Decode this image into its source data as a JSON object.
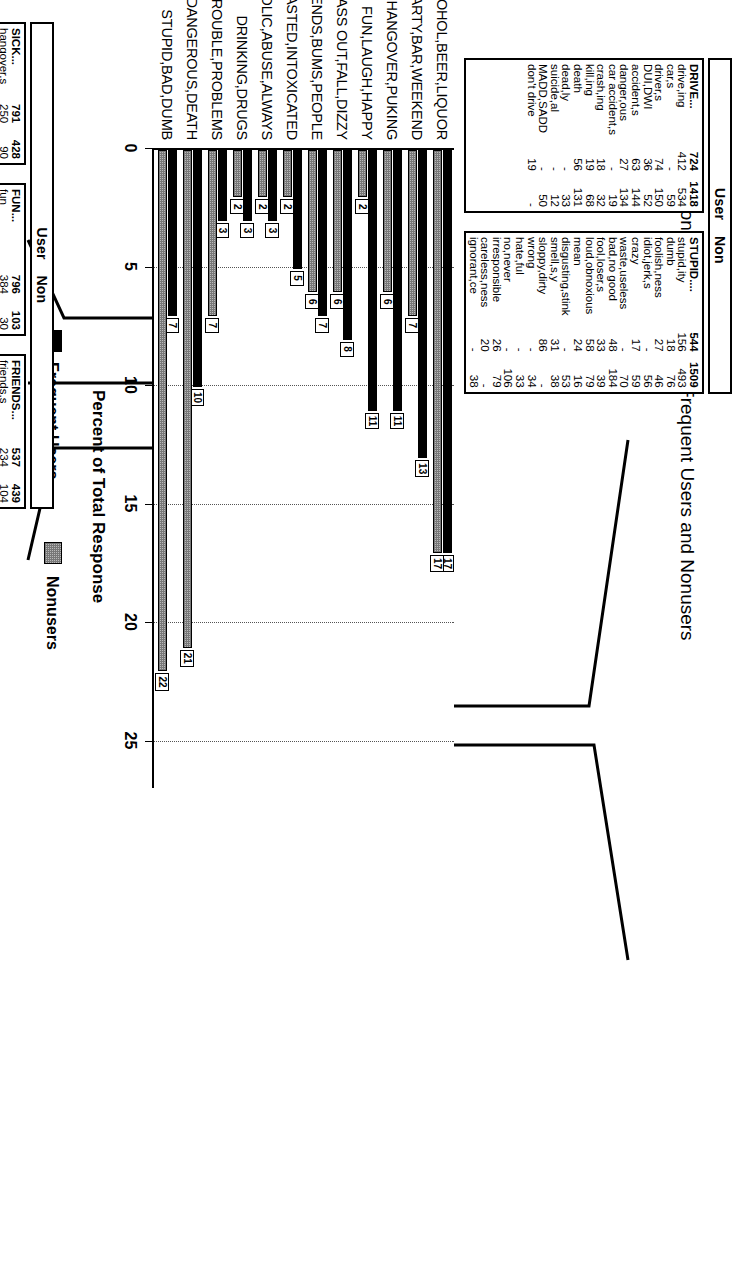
{
  "chart_data": {
    "type": "bar",
    "title": "DRUNK",
    "subtitle": "Perceptions and Attitudes by Frequent Users and Nonusers",
    "xlabel": "Percent of Total Response",
    "ylabel": "",
    "xlim": [
      0,
      27
    ],
    "xticks": [
      "0",
      "5",
      "10",
      "15",
      "20",
      "25"
    ],
    "grid": true,
    "legend_position": "bottom",
    "orientation": "horizontal",
    "categories": [
      "ALCOHOL,BEER,LIQUOR",
      "PARTY,BAR,WEEKEND",
      "SICK,HANGOVER,PUKING",
      "FUN,LAUGH,HAPPY",
      "PASS OUT,FALL,DIZZY",
      "FRIENDS,BUMS,PEOPLE",
      "WASTED,INTOXICATED",
      "ALCOHOLIC,ABUSE,ALWAYS",
      "DRINKING,DRUGS",
      "TROUBLE,PROBLEMS",
      "DRIVE,DANGEROUS,DEATH",
      "STUPID,BAD,DUMB"
    ],
    "series": [
      {
        "name": "Frequent Users",
        "color": "#000000",
        "values": [
          17,
          13,
          11,
          11,
          8,
          7,
          5,
          3,
          3,
          3,
          10,
          7
        ]
      },
      {
        "name": "Nonusers",
        "color": "#b9b9b9",
        "values": [
          17,
          7,
          6,
          2,
          6,
          6,
          2,
          2,
          2,
          7,
          21,
          22
        ]
      }
    ]
  },
  "legend": {
    "items": [
      {
        "label": "Frequent Users",
        "swatch": "black-solid"
      },
      {
        "label": "Nonusers",
        "swatch": "gray-hatched"
      }
    ]
  },
  "tables": {
    "header_labels": {
      "user": "User",
      "non": "Non"
    },
    "blocks": [
      {
        "id": "sick",
        "rows": [
          {
            "label": "SICK...",
            "user": "791",
            "non": "428"
          },
          {
            "label": "hangover,s",
            "user": "250",
            "non": "90"
          },
          {
            "label": "sick,ness",
            "user": "224",
            "non": "177"
          },
          {
            "label": "throwing up",
            "user": "62",
            "non": "54"
          },
          {
            "label": "vomit,ing",
            "user": "72",
            "non": "43"
          },
          {
            "label": "puke,ing",
            "user": "125",
            "non": "35"
          },
          {
            "label": "headache",
            "user": "58",
            "non": "29"
          }
        ]
      },
      {
        "id": "fun",
        "rows": [
          {
            "label": "FUN...",
            "user": "796",
            "non": "103"
          },
          {
            "label": "fun",
            "user": "384",
            "non": "30"
          },
          {
            "label": "happy,ness",
            "user": "52",
            "non": "-"
          },
          {
            "label": "great,er,est",
            "user": "14",
            "non": "-"
          },
          {
            "label": "good,ness",
            "user": "17",
            "non": "-"
          },
          {
            "label": "funny",
            "user": "47",
            "non": "34"
          },
          {
            "label": "laugh,giggle",
            "user": "88",
            "non": "-"
          },
          {
            "label": "silly",
            "user": "58",
            "non": "39"
          },
          {
            "label": "partying,wild",
            "user": "34",
            "non": "-"
          },
          {
            "label": "social,talk,ing",
            "user": "43",
            "non": "-"
          },
          {
            "label": "beer goggles",
            "user": "14",
            "non": "-"
          },
          {
            "label": "relax,ation",
            "user": "22",
            "non": "-"
          },
          {
            "label": "yes",
            "user": "23",
            "non": "-"
          }
        ]
      },
      {
        "id": "friends",
        "rows": [
          {
            "label": "FRIENDS...",
            "user": "537",
            "non": "439"
          },
          {
            "label": "friends,s",
            "user": "234",
            "non": "104"
          },
          {
            "label": "peer pressure",
            "user": "-",
            "non": "11"
          },
          {
            "label": "people",
            "user": "50",
            "non": "45"
          },
          {
            "label": "person,s",
            "user": "21",
            "non": "32"
          },
          {
            "label": "bum,s",
            "user": "59",
            "non": "91"
          },
          {
            "label": "drunk,s",
            "user": "-",
            "non": "26"
          },
          {
            "label": "wino",
            "user": "-",
            "non": "25"
          },
          {
            "label": "girl,s",
            "user": "67",
            "non": "-"
          },
          {
            "label": "woman,en",
            "user": "27",
            "non": "15"
          },
          {
            "label": "guy,s",
            "user": "14",
            "non": "-"
          },
          {
            "label": "man,men",
            "user": "-",
            "non": "31"
          },
          {
            "label": "me",
            "user": "55",
            "non": "-"
          },
          {
            "label": "teen-age,r",
            "user": "-",
            "non": "21"
          },
          {
            "label": "parent,s",
            "user": "10",
            "non": "-"
          },
          {
            "label": "father,hood",
            "user": "-",
            "non": "16"
          },
          {
            "label": "mother,hood",
            "user": "-",
            "non": "22"
          }
        ]
      },
      {
        "id": "drive",
        "rows": [
          {
            "label": "DRIVE...",
            "user": "724",
            "non": "1418"
          },
          {
            "label": "drive,ing",
            "user": "412",
            "non": "534"
          },
          {
            "label": "car,s",
            "user": "-",
            "non": "59"
          },
          {
            "label": "driver,s",
            "user": "74",
            "non": "150"
          },
          {
            "label": "DUI,DWI",
            "user": "36",
            "non": "52"
          },
          {
            "label": "accident,s",
            "user": "63",
            "non": "144"
          },
          {
            "label": "danger,ous",
            "user": "27",
            "non": "134"
          },
          {
            "label": "car accident,s",
            "user": "-",
            "non": "19"
          },
          {
            "label": "crash,ing",
            "user": "18",
            "non": "32"
          },
          {
            "label": "kill,ing",
            "user": "19",
            "non": "68"
          },
          {
            "label": "death",
            "user": "56",
            "non": "131"
          },
          {
            "label": "dead,ly",
            "user": "-",
            "non": "33"
          },
          {
            "label": "suicide,al",
            "user": "-",
            "non": "12"
          },
          {
            "label": "MADD,SADD",
            "user": "-",
            "non": "50"
          },
          {
            "label": "don't drive",
            "user": "19",
            "non": "-"
          }
        ]
      },
      {
        "id": "stupid",
        "rows": [
          {
            "label": "STUPID....",
            "user": "544",
            "non": "1509"
          },
          {
            "label": "stupid,ity",
            "user": "156",
            "non": "493"
          },
          {
            "label": "dumb",
            "user": "18",
            "non": "76"
          },
          {
            "label": "foolish,ness",
            "user": "27",
            "non": "46"
          },
          {
            "label": "idiot,jerk,s",
            "user": "-",
            "non": "56"
          },
          {
            "label": "crazy",
            "user": "17",
            "non": "59"
          },
          {
            "label": "waste,useless",
            "user": "-",
            "non": "70"
          },
          {
            "label": "bad,no good",
            "user": "48",
            "non": "184"
          },
          {
            "label": "fool,loser,s",
            "user": "33",
            "non": "39"
          },
          {
            "label": "loud,obnoxious",
            "user": "58",
            "non": "79"
          },
          {
            "label": "mean",
            "user": "24",
            "non": "16"
          },
          {
            "label": "disgusting,stink",
            "user": "-",
            "non": "53"
          },
          {
            "label": "smell,s,y",
            "user": "31",
            "non": "38"
          },
          {
            "label": "sloppy,dirty",
            "user": "86",
            "non": "-"
          },
          {
            "label": "wrong",
            "user": "-",
            "non": "34"
          },
          {
            "label": "hate,ful",
            "user": "-",
            "non": "33"
          },
          {
            "label": "no,never",
            "user": "-",
            "non": "106"
          },
          {
            "label": "irresponsible",
            "user": "26",
            "non": "79"
          },
          {
            "label": "careless,ness",
            "user": "20",
            "non": "-"
          },
          {
            "label": "ignorant,ce",
            "user": "-",
            "non": "38"
          }
        ]
      }
    ]
  }
}
